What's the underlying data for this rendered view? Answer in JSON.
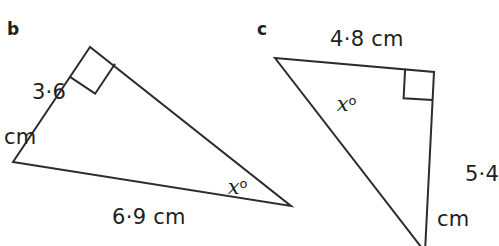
{
  "figure": {
    "type": "geometry-diagram",
    "stroke_color": "#2b2b33",
    "text_color": "#231f20",
    "background": "#ffffff",
    "stroke_width": 2
  },
  "parts": [
    {
      "letter": "b",
      "letter_pos": {
        "x": 7,
        "y": 20
      },
      "triangle": {
        "vertices": [
          {
            "name": "right-angle-apex",
            "x": 90,
            "y": 47
          },
          {
            "name": "left-vertex",
            "x": 13,
            "y": 162
          },
          {
            "name": "right-vertex",
            "x": 291,
            "y": 206
          }
        ],
        "right_angle_at": "right-angle-apex",
        "right_angle_marker_size": 30
      },
      "labels": [
        {
          "name": "side-label-3-6-cm",
          "value": "3·6",
          "unit": "cm",
          "two_line": true,
          "x": 4,
          "y": 58
        },
        {
          "name": "side-label-6-9-cm",
          "value": "6·9 cm",
          "two_line": false,
          "x": 112,
          "y": 206
        },
        {
          "name": "angle-label-x",
          "value": "x",
          "degree": "o",
          "x": 201,
          "y": 153
        }
      ]
    },
    {
      "letter": "c",
      "letter_pos": {
        "x": 257,
        "y": 20
      },
      "triangle": {
        "vertices": [
          {
            "name": "top-left-vertex",
            "x": 275,
            "y": 58
          },
          {
            "name": "right-angle-corner",
            "x": 434,
            "y": 72
          },
          {
            "name": "bottom-vertex",
            "x": 425,
            "y": 249
          }
        ],
        "right_angle_at": "right-angle-corner",
        "right_angle_marker_size": 29,
        "clipped_at_bottom": true
      },
      "labels": [
        {
          "name": "side-label-4-8-cm",
          "value": "4·8 cm",
          "two_line": false,
          "x": 330,
          "y": 28
        },
        {
          "name": "side-label-5-4-cm",
          "value": "5·4",
          "unit": "cm",
          "two_line": true,
          "x": 437,
          "y": 140
        },
        {
          "name": "angle-label-x",
          "value": "x",
          "degree": "o",
          "x": 310,
          "y": 70
        }
      ]
    }
  ]
}
